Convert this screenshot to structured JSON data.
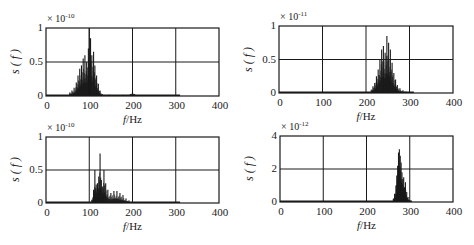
{
  "chart_data": [
    {
      "type": "line",
      "title": "",
      "xlabel": "f/Hz",
      "ylabel": "s(f)",
      "y_multiplier": "×10^-10",
      "y_exponent": "-10",
      "xlim": [
        0,
        400
      ],
      "ylim": [
        0,
        1
      ],
      "xticks": [
        0,
        100,
        200,
        300,
        400
      ],
      "yticks": [
        0,
        0.5,
        1
      ],
      "ytick_labels": [
        "0",
        "0.5",
        "1"
      ],
      "grid": true,
      "frame": {
        "left": 46,
        "top": 28,
        "right": 219,
        "bottom": 96
      },
      "description": "Spectrum concentrated at 50–130 Hz with a main peak near 100 Hz (~1.0); small bump near 200 Hz; flat baseline extends to ~310 Hz",
      "peaks": [
        {
          "f": 55,
          "v": 0.05
        },
        {
          "f": 60,
          "v": 0.08
        },
        {
          "f": 65,
          "v": 0.12
        },
        {
          "f": 70,
          "v": 0.2
        },
        {
          "f": 74,
          "v": 0.3
        },
        {
          "f": 78,
          "v": 0.4
        },
        {
          "f": 82,
          "v": 0.45
        },
        {
          "f": 86,
          "v": 0.55
        },
        {
          "f": 90,
          "v": 0.6
        },
        {
          "f": 94,
          "v": 0.5
        },
        {
          "f": 98,
          "v": 0.7
        },
        {
          "f": 100,
          "v": 1.0
        },
        {
          "f": 103,
          "v": 0.85
        },
        {
          "f": 106,
          "v": 0.6
        },
        {
          "f": 110,
          "v": 0.65
        },
        {
          "f": 113,
          "v": 0.45
        },
        {
          "f": 117,
          "v": 0.3
        },
        {
          "f": 121,
          "v": 0.18
        },
        {
          "f": 125,
          "v": 0.08
        },
        {
          "f": 130,
          "v": 0.03
        },
        {
          "f": 195,
          "v": 0.03
        },
        {
          "f": 200,
          "v": 0.06
        },
        {
          "f": 205,
          "v": 0.03
        }
      ],
      "baseline_end": 310
    },
    {
      "type": "line",
      "title": "",
      "xlabel": "f/Hz",
      "ylabel": "s(f)",
      "y_multiplier": "×10^-11",
      "y_exponent": "-11",
      "xlim": [
        0,
        400
      ],
      "ylim": [
        0,
        1
      ],
      "xticks": [
        0,
        100,
        200,
        300,
        400
      ],
      "yticks": [
        0,
        0.5,
        1
      ],
      "ytick_labels": [
        "0",
        "0.5",
        "1"
      ],
      "grid": true,
      "frame": {
        "left": 279,
        "top": 26,
        "right": 453,
        "bottom": 93
      },
      "description": "Spectrum concentrated at 210–300 Hz with a main peak near 248 Hz (~0.85)",
      "peaks": [
        {
          "f": 212,
          "v": 0.05
        },
        {
          "f": 216,
          "v": 0.1
        },
        {
          "f": 220,
          "v": 0.15
        },
        {
          "f": 224,
          "v": 0.25
        },
        {
          "f": 228,
          "v": 0.35
        },
        {
          "f": 232,
          "v": 0.5
        },
        {
          "f": 236,
          "v": 0.65
        },
        {
          "f": 240,
          "v": 0.7
        },
        {
          "f": 244,
          "v": 0.6
        },
        {
          "f": 248,
          "v": 0.85
        },
        {
          "f": 252,
          "v": 0.75
        },
        {
          "f": 256,
          "v": 0.65
        },
        {
          "f": 260,
          "v": 0.45
        },
        {
          "f": 264,
          "v": 0.3
        },
        {
          "f": 268,
          "v": 0.2
        },
        {
          "f": 272,
          "v": 0.12
        },
        {
          "f": 278,
          "v": 0.07
        },
        {
          "f": 285,
          "v": 0.04
        },
        {
          "f": 292,
          "v": 0.02
        }
      ],
      "baseline_end": 310
    },
    {
      "type": "line",
      "title": "",
      "xlabel": "f/Hz",
      "ylabel": "s(f)",
      "y_multiplier": "×10^-10",
      "y_exponent": "-10",
      "xlim": [
        0,
        400
      ],
      "ylim": [
        0,
        1
      ],
      "xticks": [
        0,
        100,
        200,
        300,
        400
      ],
      "yticks": [
        0,
        0.5,
        1
      ],
      "ytick_labels": [
        "0",
        "0.5",
        "1"
      ],
      "grid": true,
      "frame": {
        "left": 46,
        "top": 137,
        "right": 219,
        "bottom": 203
      },
      "description": "Spectrum concentrated at 105–195 Hz with a main peak near 125 Hz (~0.75) and decaying side peaks",
      "peaks": [
        {
          "f": 106,
          "v": 0.05
        },
        {
          "f": 110,
          "v": 0.2
        },
        {
          "f": 113,
          "v": 0.5
        },
        {
          "f": 116,
          "v": 0.28
        },
        {
          "f": 119,
          "v": 0.3
        },
        {
          "f": 122,
          "v": 0.4
        },
        {
          "f": 125,
          "v": 0.75
        },
        {
          "f": 128,
          "v": 0.35
        },
        {
          "f": 131,
          "v": 0.25
        },
        {
          "f": 134,
          "v": 0.5
        },
        {
          "f": 138,
          "v": 0.3
        },
        {
          "f": 143,
          "v": 0.2
        },
        {
          "f": 150,
          "v": 0.15
        },
        {
          "f": 157,
          "v": 0.18
        },
        {
          "f": 164,
          "v": 0.18
        },
        {
          "f": 171,
          "v": 0.15
        },
        {
          "f": 178,
          "v": 0.12
        },
        {
          "f": 185,
          "v": 0.07
        },
        {
          "f": 192,
          "v": 0.04
        }
      ],
      "baseline_end": 310
    },
    {
      "type": "line",
      "title": "",
      "xlabel": "f/Hz",
      "ylabel": "s(f)",
      "y_multiplier": "×10^-12",
      "y_exponent": "-12",
      "xlim": [
        0,
        400
      ],
      "ylim": [
        0,
        4
      ],
      "xticks": [
        0,
        100,
        200,
        300,
        400
      ],
      "yticks": [
        0,
        2,
        4
      ],
      "ytick_labels": [
        "0",
        "2",
        "4"
      ],
      "grid": true,
      "frame": {
        "left": 280,
        "top": 136,
        "right": 453,
        "bottom": 202
      },
      "description": "Narrow spectrum at 262–305 Hz with main peak near 275 Hz (~3.2)",
      "peaks": [
        {
          "f": 262,
          "v": 0.2
        },
        {
          "f": 265,
          "v": 0.5
        },
        {
          "f": 268,
          "v": 1.0
        },
        {
          "f": 270,
          "v": 1.6
        },
        {
          "f": 272,
          "v": 2.2
        },
        {
          "f": 274,
          "v": 3.0
        },
        {
          "f": 276,
          "v": 3.2
        },
        {
          "f": 278,
          "v": 2.8
        },
        {
          "f": 280,
          "v": 2.4
        },
        {
          "f": 282,
          "v": 1.8
        },
        {
          "f": 284,
          "v": 1.4
        },
        {
          "f": 286,
          "v": 1.5
        },
        {
          "f": 288,
          "v": 0.9
        },
        {
          "f": 290,
          "v": 1.2
        },
        {
          "f": 293,
          "v": 0.6
        },
        {
          "f": 296,
          "v": 0.3
        },
        {
          "f": 300,
          "v": 0.1
        }
      ],
      "baseline_end": 305
    }
  ],
  "labels": {
    "xlabel_var": "f",
    "xlabel_unit": "/Hz",
    "ylabel": "s ( f )",
    "times": "× 10"
  },
  "colors": {
    "line": "#1a1a1a",
    "grid": "#1a1a1a",
    "background": "#ffffff"
  }
}
